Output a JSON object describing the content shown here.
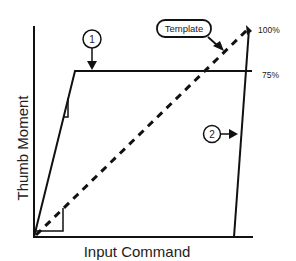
{
  "diagram": {
    "y_axis_label": "Thumb Moment",
    "x_axis_label": "Input Command",
    "levels": [
      {
        "label": "100%"
      },
      {
        "label": "75%"
      }
    ],
    "callouts": [
      {
        "label": "1",
        "target": "saturation-plateau"
      },
      {
        "label": "2",
        "target": "release-line"
      }
    ],
    "template_label": "Template"
  }
}
